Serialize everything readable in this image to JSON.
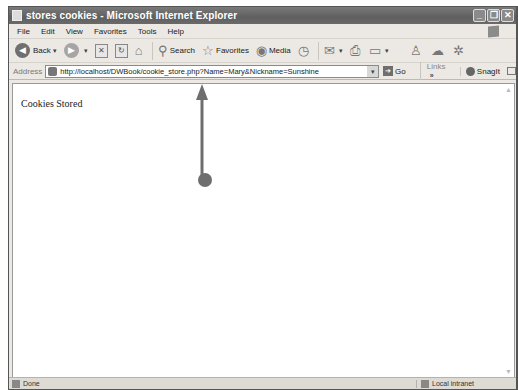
{
  "window": {
    "title": "stores cookies - Microsoft Internet Explorer",
    "controls": {
      "minimize": "_",
      "restore": "❐",
      "close": "✕"
    }
  },
  "menubar": {
    "items": [
      "File",
      "Edit",
      "View",
      "Favorites",
      "Tools",
      "Help"
    ]
  },
  "toolbar": {
    "back_label": "Back",
    "search_label": "Search",
    "favorites_label": "Favorites",
    "media_label": "Media",
    "icons": {
      "back": "◀",
      "forward": "▶",
      "stop": "✕",
      "refresh": "↻",
      "home": "⌂",
      "search": "⚲",
      "favorites": "☆",
      "media": "◉",
      "history": "◷",
      "mail": "✉",
      "print": "⎙",
      "edit": "▭",
      "messenger": "♙",
      "discuss": "☁",
      "research": "✲"
    }
  },
  "addressbar": {
    "label": "Address",
    "url": "http://localhost/DWBook/cookie_store.php?Name=Mary&Nickname=Sunshine",
    "go_label": "Go",
    "links_label": "Links",
    "links_chevron": "»",
    "snagit_label": "SnagIt"
  },
  "content": {
    "text": "Cookies Stored"
  },
  "statusbar": {
    "status": "Done",
    "zone": "Local intranet"
  },
  "annotation": {
    "arrow_color": "#6e6e6e"
  }
}
